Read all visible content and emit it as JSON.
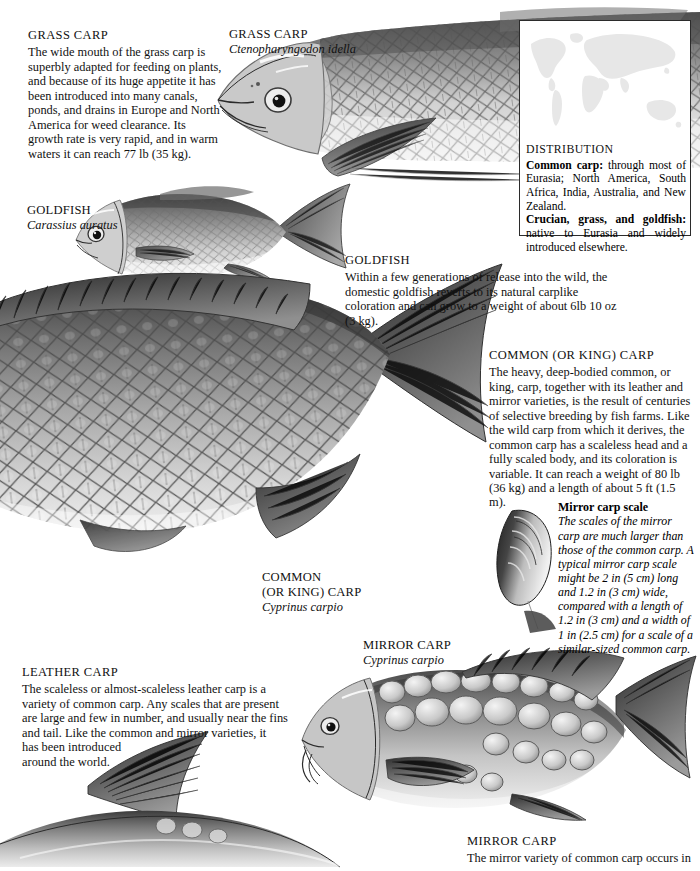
{
  "page": {
    "background": "#ffffff",
    "ink": "#111111"
  },
  "articles": {
    "grass_carp": {
      "heading_first": "G",
      "heading_rest": "RASS ",
      "heading_first2": "C",
      "heading_rest2": "ARP",
      "heading": "GRASS CARP",
      "body": "The wide mouth of the grass carp is superbly adapted for feeding on plants, and because of its huge appetite it has been introduced into many canals, ponds, and drains in Europe and North America for weed clearance. Its growth rate is very rapid, and in warm waters it can reach 77 lb (35 kg)."
    },
    "goldfish": {
      "heading": "GOLDFISH",
      "body": "Within a few generations of release into the wild, the domestic goldfish reverts to its natural carplike coloration and can grow to a weight of about 6lb 10 oz (3 kg)."
    },
    "common_carp": {
      "heading": "COMMON (OR KING) CARP",
      "body": "The heavy, deep-bodied common, or king, carp, together with its leather and mirror varieties, is the result of centuries of selective breeding by fish farms. Like the wild carp from which it derives, the common carp has a scaleless head and a fully scaled body, and its coloration is variable. It can reach a weight of 80 lb (36 kg) and a length of about 5 ft (1.5 m)."
    },
    "leather_carp": {
      "heading": "LEATHER CARP",
      "body_wide": "The scaleless or almost-scaleless leather carp is a variety of common carp. Any scales that are present are large and few in number, and usually near the fins and tail. Like the common and mirror varieties, it",
      "body_narrow": "has been introduced around the world."
    },
    "mirror_carp": {
      "heading": "MIRROR CARP",
      "body": "The mirror variety of common carp occurs in"
    }
  },
  "captions": {
    "grass_carp": {
      "common": "GRASS CARP",
      "scientific": "Ctenopharyngodon idella"
    },
    "goldfish": {
      "common": "GOLDFISH",
      "scientific": "Carassius auratus"
    },
    "common_carp": {
      "common_line1": "COMMON",
      "common_line2": "(OR KING) CARP",
      "scientific": "Cyprinus carpio"
    },
    "mirror_carp": {
      "common": "MIRROR CARP",
      "scientific": "Cyprinus carpio"
    }
  },
  "scale_note": {
    "title": "Mirror carp scale",
    "body": "The scales of the mirror carp are much larger than those of the common carp. A typical mirror carp scale might be 2 in (5 cm) long and 1.2 in (3 cm) wide, compared with a length of 1.2 in (3 cm) and a width of 1 in (2.5 cm) for a scale of a similar-sized common carp."
  },
  "distribution": {
    "heading": "DISTRIBUTION",
    "line1_bold": "Common carp:",
    "line1_rest": " through most of Eurasia; North America, South Africa, India, Australia, and New Zealand.",
    "line2_bold": "Crucian, grass, and goldfish:",
    "line2_rest": " native to Eurasia and widely introduced elsewhere.",
    "map_fill": "#e8e8e8",
    "border_color": "#2b2b2b"
  },
  "illustrations": [
    {
      "name": "grass-carp-illustration",
      "subject": "grass carp head and body, lateral view"
    },
    {
      "name": "goldfish-illustration",
      "subject": "goldfish, lateral view"
    },
    {
      "name": "common-carp-illustration",
      "subject": "common or king carp, large lateral view"
    },
    {
      "name": "mirror-carp-illustration",
      "subject": "mirror carp, lateral view"
    },
    {
      "name": "leather-carp-illustration",
      "subject": "leather carp, lateral view"
    },
    {
      "name": "mirror-carp-scale-illustration",
      "subject": "single large mirror carp scale"
    }
  ]
}
